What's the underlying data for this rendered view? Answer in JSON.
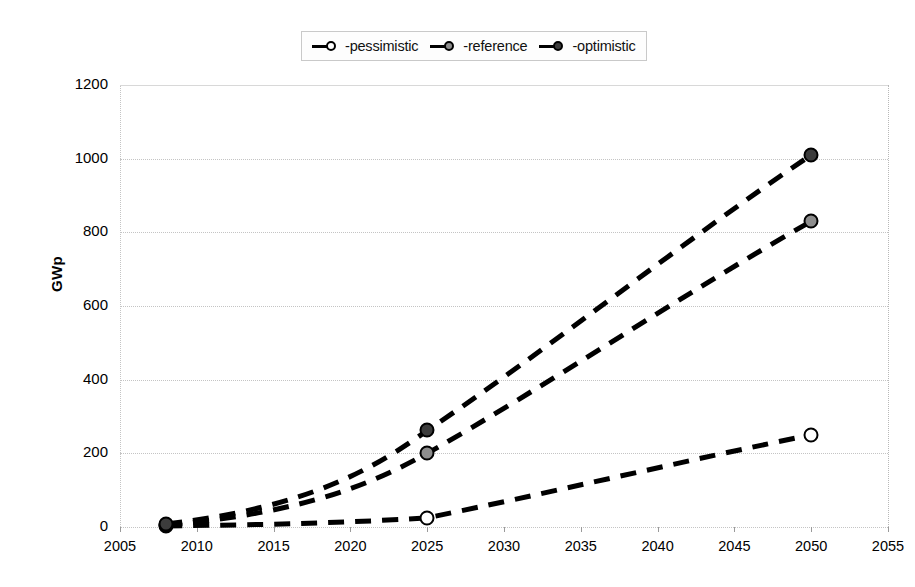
{
  "chart_data": {
    "type": "line",
    "title": "",
    "xlabel": "",
    "ylabel": "GWp",
    "xlim": [
      2005,
      2055
    ],
    "ylim": [
      0,
      1200
    ],
    "x": [
      2008,
      2025,
      2050
    ],
    "xticks": [
      "2005",
      "2010",
      "2015",
      "2020",
      "2025",
      "2030",
      "2035",
      "2040",
      "2045",
      "2050",
      "2055"
    ],
    "yticks": [
      "0",
      "200",
      "400",
      "600",
      "800",
      "1000",
      "1200"
    ],
    "grid": "horizontal-dotted",
    "legend_position": "top-center",
    "series": [
      {
        "name": "-pessimistic",
        "values": [
          3,
          25,
          250
        ],
        "marker": "open-circle",
        "marker_fill": "#ffffff",
        "line_style": "dashed"
      },
      {
        "name": "-reference",
        "values": [
          5,
          200,
          830
        ],
        "marker": "filled-circle",
        "marker_fill": "#8d8d8d",
        "line_style": "dashed"
      },
      {
        "name": "-optimistic",
        "values": [
          8,
          262,
          1010
        ],
        "marker": "filled-circle",
        "marker_fill": "#3c3c3c",
        "line_style": "dashed"
      }
    ]
  },
  "legend": {
    "entries": [
      {
        "label": "pessimistic",
        "swatch": "open-circle-icon"
      },
      {
        "label": "reference",
        "swatch": "gray-circle-icon"
      },
      {
        "label": "optimistic",
        "swatch": "dark-circle-icon"
      }
    ]
  },
  "axes": {
    "y_title": "GWp",
    "y_tick_labels": [
      "1200",
      "1000",
      "800",
      "600",
      "400",
      "200",
      "0"
    ],
    "x_tick_labels": [
      "2005",
      "2010",
      "2015",
      "2020",
      "2025",
      "2030",
      "2035",
      "2040",
      "2045",
      "2050",
      "2055"
    ]
  },
  "colors": {
    "pessimistic": "#ffffff",
    "reference": "#8d8d8d",
    "optimistic": "#3c3c3c",
    "line": "#000000",
    "grid": "#c4c4c4",
    "background": "#ffffff"
  }
}
